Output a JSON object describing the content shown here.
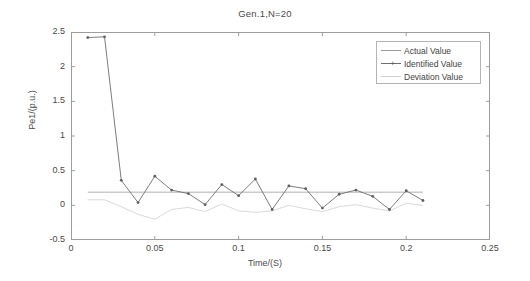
{
  "chart_data": {
    "type": "line",
    "title": "Gen.1,N=20",
    "xlabel": "Time/(S)",
    "ylabel": "Pe1/(p.u.)",
    "xlim": [
      0,
      0.25
    ],
    "ylim": [
      -0.5,
      2.5
    ],
    "xticks": [
      0,
      0.05,
      0.1,
      0.15,
      0.2,
      0.25
    ],
    "xtick_labels": [
      "0",
      "0.05",
      "0.1",
      "0.15",
      "0.2",
      "0.25"
    ],
    "yticks": [
      -0.5,
      0,
      0.5,
      1,
      1.5,
      2,
      2.5
    ],
    "ytick_labels": [
      "-0.5",
      "0",
      "0.5",
      "1",
      "1.5",
      "2",
      "2.5"
    ],
    "grid": false,
    "legend_position": "upper right",
    "x": [
      0.01,
      0.02,
      0.03,
      0.04,
      0.05,
      0.06,
      0.07,
      0.08,
      0.09,
      0.1,
      0.11,
      0.12,
      0.13,
      0.14,
      0.15,
      0.16,
      0.17,
      0.18,
      0.19,
      0.2,
      0.21
    ],
    "series": [
      {
        "name": "Actual Value",
        "color": "#9a9a9a",
        "style": "solid",
        "marker": "none",
        "values": [
          0.19,
          0.19,
          0.19,
          0.19,
          0.19,
          0.19,
          0.19,
          0.19,
          0.19,
          0.19,
          0.19,
          0.19,
          0.19,
          0.19,
          0.19,
          0.19,
          0.19,
          0.19,
          0.19,
          0.19,
          0.19
        ]
      },
      {
        "name": "Identified Value",
        "color": "#6e6e6e",
        "style": "solid",
        "marker": "dot",
        "values": [
          2.42,
          2.43,
          0.36,
          0.04,
          0.42,
          0.22,
          0.17,
          0.01,
          0.3,
          0.14,
          0.38,
          -0.06,
          0.28,
          0.24,
          -0.04,
          0.16,
          0.22,
          0.13,
          -0.06,
          0.21,
          0.07
        ]
      },
      {
        "name": "Deviation Value",
        "color": "#cfcfcf",
        "style": "solid",
        "marker": "none",
        "values": [
          0.08,
          0.08,
          -0.02,
          -0.13,
          -0.2,
          -0.06,
          -0.03,
          -0.09,
          0.02,
          -0.08,
          -0.1,
          -0.08,
          0.0,
          -0.05,
          -0.09,
          -0.02,
          0.01,
          -0.04,
          -0.08,
          0.03,
          0.0
        ]
      }
    ]
  },
  "legend": {
    "entries": [
      {
        "label": "Actual Value"
      },
      {
        "label": "Identified Value"
      },
      {
        "label": "Deviation Value"
      }
    ]
  }
}
